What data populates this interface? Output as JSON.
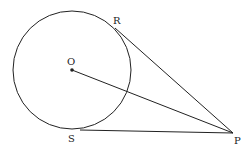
{
  "diagram": {
    "type": "circle-with-tangents",
    "stroke_color": "#222222",
    "background": "#ffffff",
    "circle": {
      "center_label": "O",
      "cx": 72,
      "cy": 70,
      "r": 59
    },
    "points": {
      "O": {
        "label": "O",
        "x": 72,
        "y": 70
      },
      "R": {
        "label": "R",
        "x": 115,
        "y": 28
      },
      "S": {
        "label": "S",
        "x": 80,
        "y": 130
      },
      "P": {
        "label": "P",
        "x": 233,
        "y": 133
      }
    },
    "segments": [
      {
        "name": "OP",
        "from": "O",
        "to": "P"
      },
      {
        "name": "RP",
        "from": "R",
        "to": "P"
      },
      {
        "name": "SP",
        "from": "S",
        "to": "P"
      }
    ]
  }
}
